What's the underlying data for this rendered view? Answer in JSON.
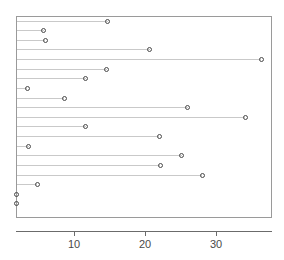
{
  "chart_data": {
    "type": "scatter",
    "subtype": "lollipop-dot-plot",
    "orientation": "horizontal",
    "title": "",
    "xlabel": "",
    "ylabel": "",
    "xlim": [
      1.8,
      37.9
    ],
    "ylim": [
      0,
      20
    ],
    "grid": false,
    "legend": null,
    "baseline_value": 1.8,
    "xticks": [
      10,
      20,
      30
    ],
    "xtick_labels": [
      "10",
      "20",
      "30"
    ],
    "marker": "open-circle",
    "marker_color": "#4a4a4a",
    "stem_color": "#c9c9c9",
    "panel_border_color": "#9a9a9a",
    "axis_color": "#6b6b6b",
    "categories": [
      "row-1",
      "row-2",
      "row-3",
      "row-4",
      "row-5",
      "row-6",
      "row-7",
      "row-8",
      "row-9",
      "row-10",
      "row-11",
      "row-12",
      "row-13",
      "row-14",
      "row-15",
      "row-16",
      "row-17",
      "row-18",
      "row-19",
      "row-20"
    ],
    "values": [
      14.6,
      5.6,
      5.8,
      20.5,
      36.2,
      14.5,
      11.5,
      3.3,
      8.5,
      25.9,
      34.0,
      11.5,
      21.9,
      3.5,
      25.0,
      22.0,
      27.9,
      4.7,
      1.8,
      1.8
    ],
    "points": [
      {
        "index": 1,
        "value": 14.6
      },
      {
        "index": 2,
        "value": 5.6
      },
      {
        "index": 3,
        "value": 5.8
      },
      {
        "index": 4,
        "value": 20.5
      },
      {
        "index": 5,
        "value": 36.2
      },
      {
        "index": 6,
        "value": 14.5
      },
      {
        "index": 7,
        "value": 11.5
      },
      {
        "index": 8,
        "value": 3.3
      },
      {
        "index": 9,
        "value": 8.5
      },
      {
        "index": 10,
        "value": 25.9
      },
      {
        "index": 11,
        "value": 34.0
      },
      {
        "index": 12,
        "value": 11.5
      },
      {
        "index": 13,
        "value": 21.9
      },
      {
        "index": 14,
        "value": 3.5
      },
      {
        "index": 15,
        "value": 25.0
      },
      {
        "index": 16,
        "value": 22.0
      },
      {
        "index": 17,
        "value": 27.9
      },
      {
        "index": 18,
        "value": 4.7
      },
      {
        "index": 19,
        "value": 1.8
      },
      {
        "index": 20,
        "value": 1.8
      }
    ]
  }
}
